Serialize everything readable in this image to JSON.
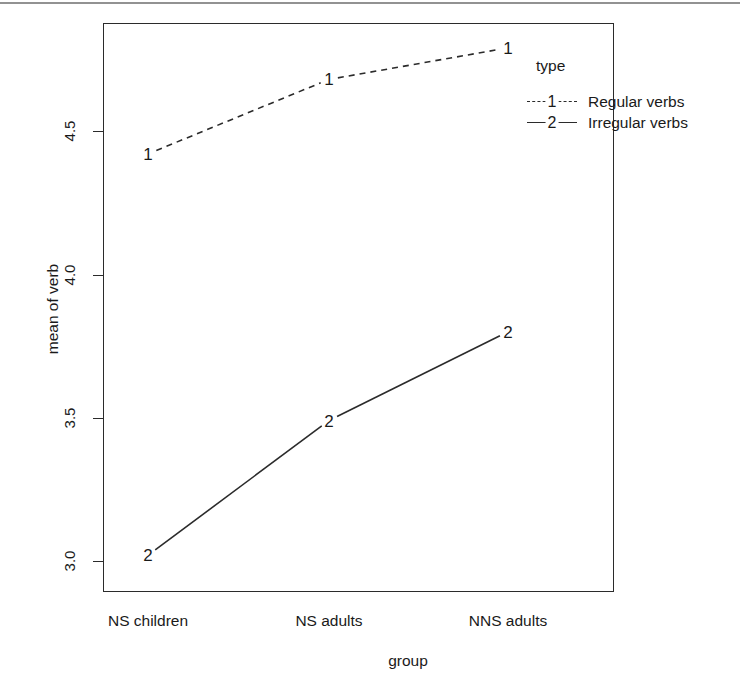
{
  "chart_data": {
    "type": "line",
    "title": "",
    "xlabel": "group",
    "ylabel": "mean of verb",
    "categories": [
      "NS children",
      "NS adults",
      "NNS adults"
    ],
    "ylim": [
      2.93,
      4.92
    ],
    "yticks": [
      3.0,
      3.5,
      4.0,
      4.5
    ],
    "ytick_labels": [
      "3.0",
      "3.5",
      "4.0",
      "4.5"
    ],
    "grid": false,
    "legend": {
      "title": "type",
      "position": "top-right-outside",
      "entries": [
        {
          "label": "Regular verbs",
          "symbol": "1",
          "line_style": "dashed"
        },
        {
          "label": "Irregular verbs",
          "symbol": "2",
          "line_style": "solid"
        }
      ]
    },
    "series": [
      {
        "name": "Regular verbs",
        "symbol": "1",
        "line_style": "dashed",
        "values": [
          4.42,
          4.68,
          4.79
        ],
        "point_labels": [
          "1",
          "1",
          "1"
        ]
      },
      {
        "name": "Irregular verbs",
        "symbol": "2",
        "line_style": "solid",
        "values": [
          3.02,
          3.49,
          3.8
        ],
        "point_labels": [
          "2",
          "2",
          "2"
        ]
      }
    ],
    "colors": {
      "line": "#2b2b2b",
      "axis": "#2b2b2b",
      "background": "#ffffff"
    }
  },
  "axes": {
    "ytick_labels": [
      "4.5",
      "4.0",
      "3.5",
      "3.0"
    ],
    "xtick_labels": [
      "NS children",
      "NS adults",
      "NNS adults"
    ],
    "y_title": "mean of verb",
    "x_title": "group"
  },
  "legend": {
    "title": "type",
    "rows": [
      {
        "symbol": "1",
        "label": "Regular verbs"
      },
      {
        "symbol": "2",
        "label": "Irregular verbs"
      }
    ]
  },
  "points": {
    "regular": [
      "1",
      "1",
      "1"
    ],
    "irregular": [
      "2",
      "2",
      "2"
    ]
  }
}
